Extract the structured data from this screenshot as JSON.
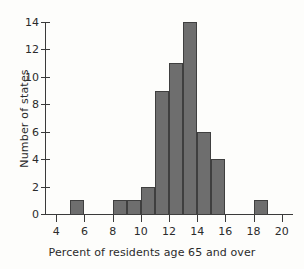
{
  "chart_data": {
    "type": "bar",
    "title": "",
    "subtitle": "",
    "xlabel": "Percent of residents age 65 and over",
    "ylabel": "Number of states",
    "grid": false,
    "legend": null,
    "xlim": [
      3.2,
      20.8
    ],
    "ylim": [
      0,
      14
    ],
    "bin_width": 1,
    "x_ticks": [
      4,
      6,
      8,
      10,
      12,
      14,
      16,
      18,
      20
    ],
    "y_ticks": [
      0,
      2,
      4,
      6,
      8,
      10,
      12,
      14
    ],
    "bin_edges": [
      5,
      6,
      8,
      9,
      10,
      11,
      12,
      13,
      14,
      15,
      16,
      18,
      19
    ],
    "bins": [
      {
        "start": 5,
        "end": 6,
        "value": 1
      },
      {
        "start": 8,
        "end": 9,
        "value": 1
      },
      {
        "start": 9,
        "end": 10,
        "value": 1
      },
      {
        "start": 10,
        "end": 11,
        "value": 2
      },
      {
        "start": 11,
        "end": 12,
        "value": 9
      },
      {
        "start": 12,
        "end": 13,
        "value": 11
      },
      {
        "start": 13,
        "end": 14,
        "value": 14
      },
      {
        "start": 14,
        "end": 15,
        "value": 6
      },
      {
        "start": 15,
        "end": 16,
        "value": 4
      },
      {
        "start": 18,
        "end": 19,
        "value": 1
      }
    ],
    "categories": [
      "5-6",
      "8-9",
      "9-10",
      "10-11",
      "11-12",
      "12-13",
      "13-14",
      "14-15",
      "15-16",
      "18-19"
    ],
    "values": [
      1,
      1,
      1,
      2,
      9,
      11,
      14,
      6,
      4,
      1
    ],
    "bar_color": "#6e6e6e",
    "bar_edge_color": "#3f3f3f",
    "axis_color": "#3a3a3a",
    "background_color": "#fdfdfb"
  }
}
